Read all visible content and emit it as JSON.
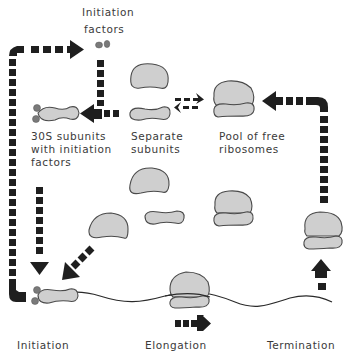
{
  "labels": {
    "initiation_factors": [
      "Initiation",
      "factors"
    ],
    "subunits_with_factors": [
      "30S subunits",
      "with initiation",
      "factors"
    ],
    "separate_subunits": [
      "Separate",
      "subunits"
    ],
    "pool_free_ribosomes": [
      "Pool of free",
      "ribosomes"
    ],
    "initiation": "Initiation",
    "elongation": "Elongation",
    "termination": "Termination"
  },
  "colors": {
    "subunit_fill": "#cfcfcf",
    "subunit_outline": "#4a4a4a",
    "arrow": "#1f1f1f",
    "factor": "#7a7a7a",
    "text": "#3a3a3a"
  }
}
